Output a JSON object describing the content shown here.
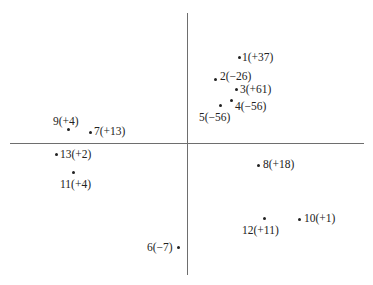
{
  "diagram": {
    "type": "scatter-quadrant",
    "axes": {
      "origin_px": [
        187,
        144
      ]
    },
    "points": [
      {
        "id": "1",
        "label": "1(+37)",
        "value": "+37"
      },
      {
        "id": "2",
        "label": "2(−26)",
        "value": "-26"
      },
      {
        "id": "3",
        "label": "3(+61)",
        "value": "+61"
      },
      {
        "id": "4",
        "label": "4(−56)",
        "value": "-56"
      },
      {
        "id": "5",
        "label": "5(−56)",
        "value": "-56"
      },
      {
        "id": "6",
        "label": "6(−7)",
        "value": "-7"
      },
      {
        "id": "7",
        "label": "7(+13)",
        "value": "+13"
      },
      {
        "id": "8",
        "label": "8(+18)",
        "value": "+18"
      },
      {
        "id": "9",
        "label": "9(+4)",
        "value": "+4"
      },
      {
        "id": "10",
        "label": "10(+1)",
        "value": "+1"
      },
      {
        "id": "11",
        "label": "11(+4)",
        "value": "+4"
      },
      {
        "id": "12",
        "label": "12(+11)",
        "value": "+11"
      },
      {
        "id": "13",
        "label": "13(+2)",
        "value": "+2"
      }
    ]
  }
}
